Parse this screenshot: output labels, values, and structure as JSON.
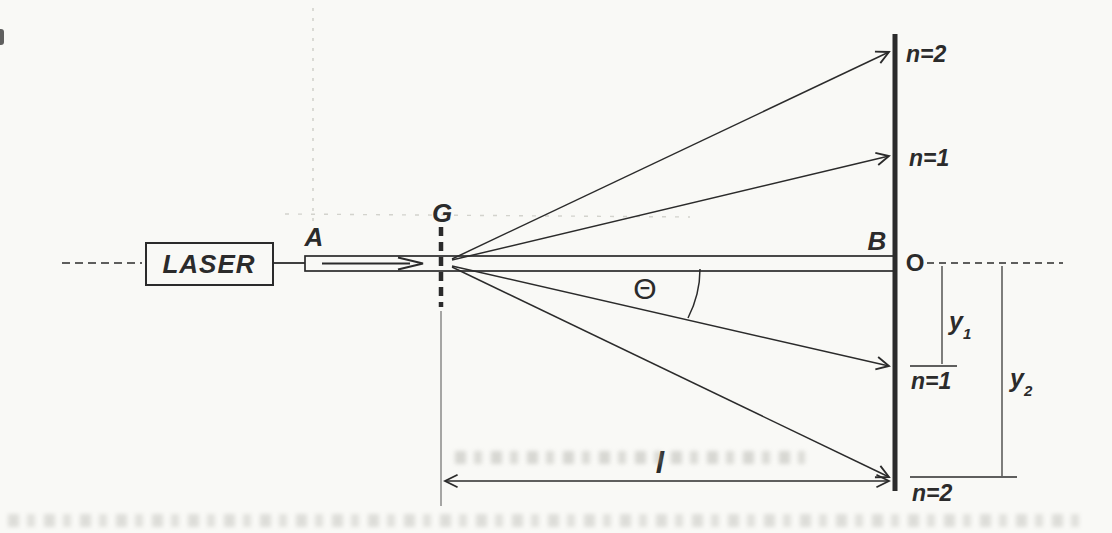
{
  "colors": {
    "paper": "#f9f9f6",
    "ink": "#2b2b2b",
    "beam_fill": "#e8e8e4",
    "beam_dot": "#9b9b95"
  },
  "diagram": {
    "type_note": "laser diffraction grating wavelength measurement",
    "laser_label": "LASER",
    "beam_point_label": "A",
    "grating_label": "G",
    "screen_point_label": "B",
    "origin_label": "O",
    "angle_label": "Θ",
    "orders": {
      "top_n2": "n=2",
      "top_n1": "n=1",
      "bottom_n1": "n=1",
      "bottom_n2": "n=2"
    },
    "measure_y1": {
      "base": "y",
      "sub": "1"
    },
    "measure_y2": {
      "base": "y",
      "sub": "2"
    },
    "distance_label": "l"
  }
}
